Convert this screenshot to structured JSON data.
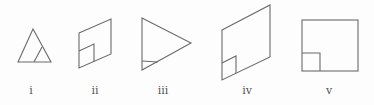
{
  "figures": [
    {
      "id": "i",
      "label": "i",
      "shape": "triangle with small inner triangle at bottom-right corner"
    },
    {
      "id": "ii",
      "label": "ii",
      "shape": "parallelogram with small inner square at bottom-left corner"
    },
    {
      "id": "iii",
      "label": "iii",
      "shape": "right-pointing triangle with small inner triangle at bottom-left corner"
    },
    {
      "id": "iv",
      "label": "iv",
      "shape": "large parallelogram with small inner square at bottom-left corner"
    },
    {
      "id": "v",
      "label": "v",
      "shape": "square with small inner square at bottom-left corner"
    }
  ],
  "style": {
    "stroke_color": "#6a6a6a",
    "label_color": "#555555"
  }
}
